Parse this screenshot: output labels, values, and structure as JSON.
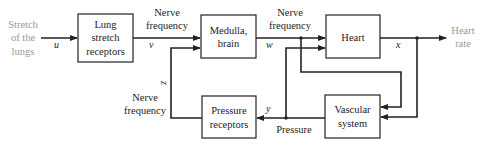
{
  "diagram": {
    "type": "block diagram",
    "input": {
      "lines": [
        "Stretch",
        "of the",
        "lungs"
      ]
    },
    "output": {
      "lines": [
        "Heart",
        "rate"
      ]
    },
    "blocks": {
      "lung": {
        "lines": [
          "Lung",
          "stretch",
          "receptors"
        ]
      },
      "medulla": {
        "lines": [
          "Medulla,",
          "brain"
        ]
      },
      "heart": {
        "lines": [
          "Heart"
        ]
      },
      "pressure_receptors": {
        "lines": [
          "Pressure",
          "receptors"
        ]
      },
      "vascular": {
        "lines": [
          "Vascular",
          "system"
        ]
      }
    },
    "labels": {
      "nerve_freq_v": {
        "lines": [
          "Nerve",
          "frequency"
        ]
      },
      "nerve_freq_w": {
        "lines": [
          "Nerve",
          "frequency"
        ]
      },
      "nerve_freq_z": {
        "lines": [
          "Nerve",
          "frequency"
        ]
      },
      "pressure": "Pressure"
    },
    "signals": {
      "u": "u",
      "v": "v",
      "w": "w",
      "x": "x",
      "y": "y",
      "z": "z"
    }
  }
}
